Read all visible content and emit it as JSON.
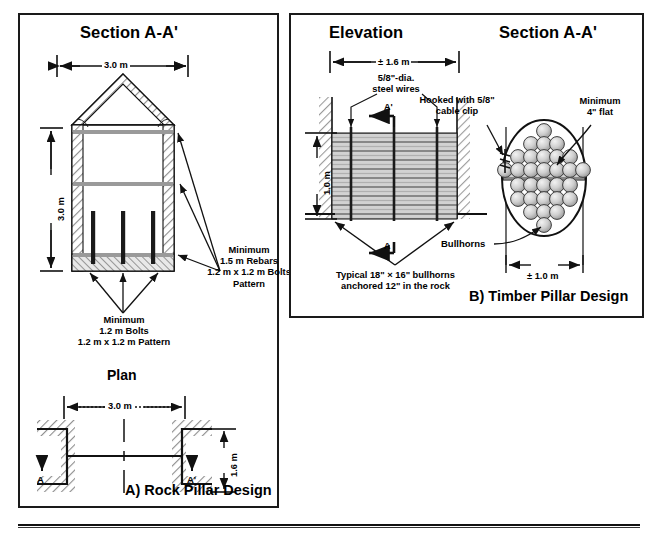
{
  "figure": {
    "panel_a": {
      "title_section": "Section A-A'",
      "title_plan": "Plan",
      "caption": "A) Rock Pillar Design",
      "dim_width_top": "3.0 m",
      "dim_height": "3.0 m",
      "plan_dim_width": "3.0 m",
      "plan_dim_depth": "1.6 m",
      "section_marker_left": "A",
      "section_marker_right": "A'",
      "angle_left": "45",
      "angle_right": "45",
      "note_rebars": [
        "Minimum",
        "1.5 m Rebars",
        "1.2 m x 1.2 m Bolts",
        "Pattern"
      ],
      "note_bolts": [
        "Minimum",
        "1.2 m Bolts",
        "1.2 m x 1.2 m Pattern"
      ]
    },
    "panel_b": {
      "title_elevation": "Elevation",
      "title_section": "Section A-A'",
      "caption": "B) Timber Pillar Design",
      "dim_width_top": "± 1.6 m",
      "dim_height": "1.0 m",
      "dim_width_bottom": "± 1.0 m",
      "note_wires": [
        "5/8\"-dia.",
        "steel wires"
      ],
      "note_bullhorns": [
        "Typical 18\" × 16\" bullhorns",
        "anchored 12\" in the rock"
      ],
      "note_cable_clip": [
        "Hooked with 5/8\"",
        "cable clip"
      ],
      "note_min_flat": [
        "Minimum",
        "4\" flat"
      ],
      "label_bullhorns": "Bullhorns",
      "section_marker_left": "A",
      "section_marker_right": "A'"
    },
    "colors": {
      "ink": "#111111",
      "hatch": "#8a8a8a",
      "fill_light": "#d9d9d9",
      "fill_mid": "#b5b5b5",
      "rebar_gray": "#9a9a9a"
    }
  }
}
